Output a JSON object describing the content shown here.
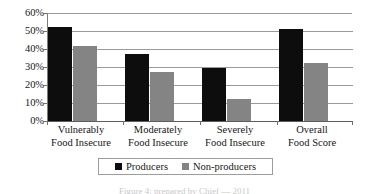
{
  "chart_data": {
    "type": "bar",
    "title": "",
    "subtitle": "",
    "xlabel": "",
    "ylabel": "",
    "ylim": [
      0,
      60
    ],
    "ytick_labels": [
      "60%",
      "50%",
      "40%",
      "30%",
      "20%",
      "10%",
      "0%"
    ],
    "ytick_values": [
      60,
      50,
      40,
      30,
      20,
      10,
      0
    ],
    "grid": true,
    "legend_position": "bottom",
    "categories": [
      "Vulnerably Food Insecure",
      "Moderately Food Insecure",
      "Severely Food Insecure",
      "Overall Food Score"
    ],
    "category_lines": [
      [
        "Vulnerably",
        "Food Insecure"
      ],
      [
        "Moderately",
        "Food Insecure"
      ],
      [
        "Severely",
        "Food Insecure"
      ],
      [
        "Overall",
        "Food Score"
      ]
    ],
    "series": [
      {
        "name": "Producers",
        "color": "#0d0d0d",
        "values": [
          52.5,
          37.0,
          29.5,
          51.0
        ]
      },
      {
        "name": "Non-producers",
        "color": "#848484",
        "values": [
          41.5,
          27.5,
          12.0,
          32.0
        ]
      }
    ]
  },
  "legend": {
    "entries": [
      {
        "label": "Producers",
        "swatch": "producers-swatch"
      },
      {
        "label": "Non-producers",
        "swatch": "non-producers-swatch"
      }
    ]
  },
  "caption": {
    "text": "Figure 4: prepared by Chief —  2011"
  }
}
